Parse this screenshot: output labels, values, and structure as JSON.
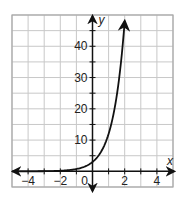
{
  "chart_data": {
    "type": "line",
    "title": "",
    "xlabel": "x",
    "ylabel": "y",
    "xlim": [
      -5,
      5
    ],
    "ylim": [
      -5,
      50
    ],
    "grid": true,
    "x_grid_step": 1,
    "y_grid_step": 5,
    "x_tick_labels": [
      {
        "value": -4,
        "label": "−4"
      },
      {
        "value": -2,
        "label": "−2"
      },
      {
        "value": 0,
        "label": "0"
      },
      {
        "value": 2,
        "label": "2"
      },
      {
        "value": 4,
        "label": "4"
      }
    ],
    "y_tick_labels": [
      {
        "value": 10,
        "label": "10"
      },
      {
        "value": 20,
        "label": "20"
      },
      {
        "value": 30,
        "label": "30"
      },
      {
        "value": 40,
        "label": "40"
      }
    ],
    "series": [
      {
        "name": "exponential curve",
        "equation_estimate": "y = 3(4)^x",
        "x": [
          -5,
          -4,
          -3,
          -2,
          -1,
          0,
          0.5,
          1,
          1.5,
          2
        ],
        "values": [
          0.003,
          0.012,
          0.047,
          0.19,
          0.75,
          3,
          6,
          12,
          24,
          48
        ],
        "arrow_ends": true
      }
    ],
    "legend": null
  },
  "colors": {
    "grid": "#c8c8c8",
    "border": "#a8a8a8",
    "axis": "#111111",
    "curve": "#111111"
  }
}
